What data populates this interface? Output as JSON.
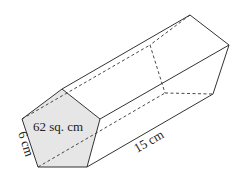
{
  "diagram": {
    "type": "pentagonal-prism",
    "front_face": {
      "area_label": "62 sq. cm",
      "fill": "#e6e6e6",
      "vertices": [
        [
          62,
          89
        ],
        [
          100,
          119
        ],
        [
          87,
          167
        ],
        [
          38,
          167
        ],
        [
          22,
          119
        ]
      ]
    },
    "back_face": {
      "vertices": [
        [
          190,
          15
        ],
        [
          229,
          45
        ],
        [
          213,
          94
        ],
        [
          165,
          93
        ],
        [
          150,
          45
        ]
      ]
    },
    "labels": {
      "side_length": "6 cm",
      "prism_length": "15 cm",
      "area": "62 sq. cm"
    },
    "colors": {
      "stroke": "#333333",
      "face_fill": "#e6e6e6",
      "background": "#ffffff"
    }
  }
}
